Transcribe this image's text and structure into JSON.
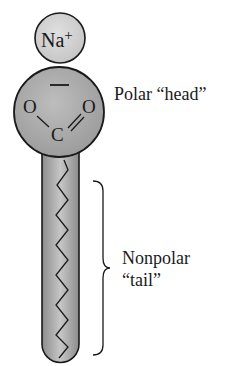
{
  "diagram": {
    "type": "soap-molecule-structure",
    "ion": {
      "label": "Na",
      "charge": "+"
    },
    "head": {
      "atoms": {
        "left_oxygen": "O",
        "right_oxygen": "O",
        "carbon": "C"
      },
      "charge_mark": "−",
      "label": "Polar “head”"
    },
    "tail": {
      "label_line1": "Nonpolar",
      "label_line2": "“tail”"
    },
    "colors": {
      "ion_fill": "#d4d4d4",
      "head_fill": "#a9a9a9",
      "tail_fill": "#b0b0b0",
      "stroke": "#1a1a1a"
    }
  }
}
